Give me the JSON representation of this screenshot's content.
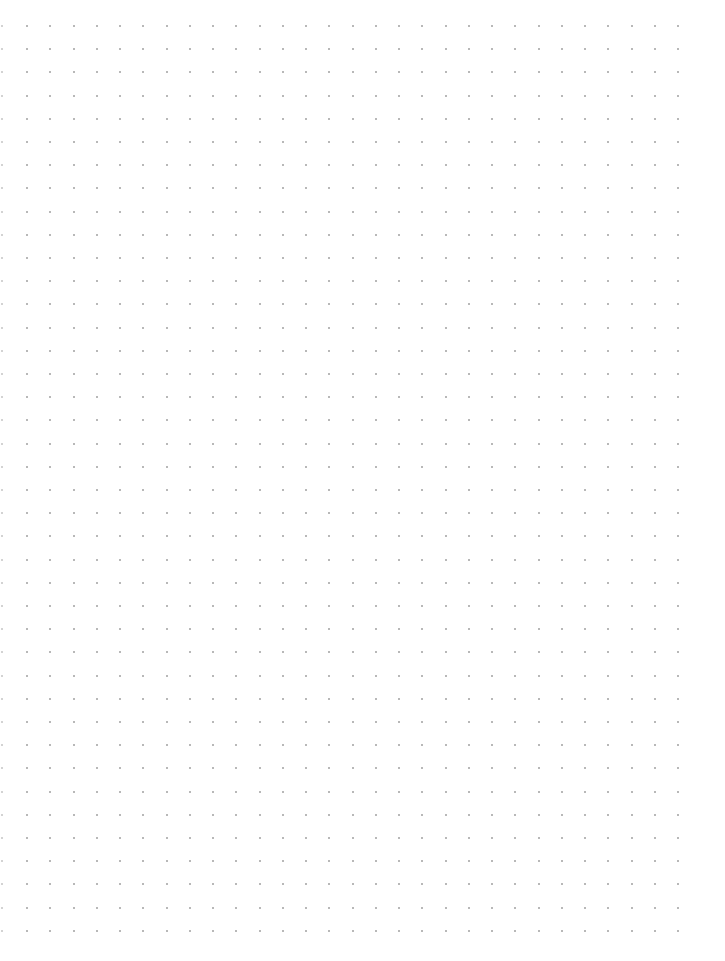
{
  "page": {
    "type": "dot-grid-paper",
    "background": "#ffffff"
  },
  "grid": {
    "dot_color": "#a0a0a0",
    "edge_dot_color": "#c4c4c4",
    "dot_size": 2,
    "first_x": 26,
    "first_y": 25,
    "spacing_x": 23.25,
    "spacing_y": 23.2,
    "columns": 29,
    "rows": 40,
    "edge_column_x": 2
  }
}
